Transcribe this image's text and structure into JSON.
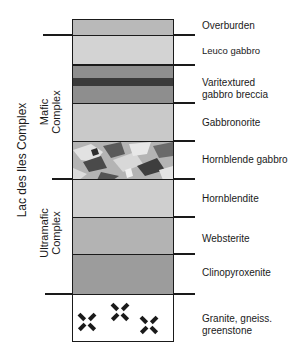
{
  "diagram": {
    "title": "Lac des Iles Complex",
    "groups": [
      {
        "label": "Mafic Complex",
        "line1": "Mafic",
        "line2": "Complex"
      },
      {
        "label": "Ultramafic Complex",
        "line1": "Ultramafic",
        "line2": "Complex"
      }
    ],
    "layers": [
      {
        "name": "Overburden",
        "label_line1": "Overburden",
        "label_line2": "",
        "color": "#b9b9b9",
        "top": 0,
        "height": 16
      },
      {
        "name": "Leuco gabbro",
        "label_line1": "Leuco gabbro",
        "label_line2": "",
        "color": "#d3d3d3",
        "top": 16,
        "height": 30
      },
      {
        "name": "Varitextured gabbro breccia",
        "label_line1": "Varitextured",
        "label_line2": "gabbro breccia",
        "color": "#8e8e8e",
        "accent_color": "#3a3a3a",
        "top": 46,
        "height": 38
      },
      {
        "name": "Gabbronorite",
        "label_line1": "Gabbronorite",
        "label_line2": "",
        "color": "#c9c9c9",
        "top": 84,
        "height": 38
      },
      {
        "name": "Hornblende gabbro",
        "label_line1": "Hornblende gabbro",
        "label_line2": "",
        "color": "#9a9a9a",
        "top": 122,
        "height": 38
      },
      {
        "name": "Hornblendite",
        "label_line1": "Hornblendite",
        "label_line2": "",
        "color": "#cfcfcf",
        "top": 160,
        "height": 38
      },
      {
        "name": "Websterite",
        "label_line1": "Websterite",
        "label_line2": "",
        "color": "#b3b3b3",
        "top": 198,
        "height": 37
      },
      {
        "name": "Clinopyroxenite",
        "label_line1": "Clinopyroxenite",
        "label_line2": "",
        "color": "#9c9c9c",
        "top": 235,
        "height": 40
      },
      {
        "name": "Granite, gneiss, greenstone",
        "label_line1": "Granite, gneiss.",
        "label_line2": "greenstone",
        "color": "#ffffff",
        "top": 275,
        "height": 48
      }
    ],
    "symbols": [
      {
        "name": "granite-x-mark",
        "x": 87,
        "y": 322
      },
      {
        "name": "granite-x-mark",
        "x": 120,
        "y": 312
      },
      {
        "name": "granite-x-mark",
        "x": 149,
        "y": 325
      }
    ],
    "line_color": "#1a1a1a"
  }
}
